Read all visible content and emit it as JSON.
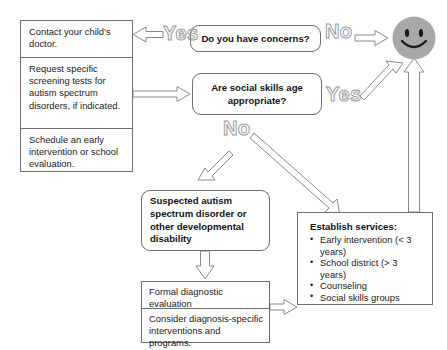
{
  "diagram": {
    "colors": {
      "stroke": "#6e6e6e",
      "text": "#1b1b1b",
      "arrow_stroke": "#8a8a8a",
      "label_outline": "#9a9a9a",
      "smiley_fill": "#a8a8a8",
      "background": "#ffffff"
    },
    "left_column": {
      "name": "action-steps",
      "cells": [
        {
          "text": "Contact your child’s doctor."
        },
        {
          "text": "Request specific screening tests for autism spectrum disorders, if indicated."
        },
        {
          "text": "Schedule an early intervention or school evaluation."
        }
      ]
    },
    "decisions": [
      {
        "id": "concerns",
        "text": "Do you have concerns?"
      },
      {
        "id": "social-skills",
        "text": "Are social skills age appropriate?"
      }
    ],
    "suspected": {
      "text": "Suspected autism spectrum disorder or other developmental disability"
    },
    "formal_stack": {
      "cells": [
        {
          "text": "Formal diagnostic evaluation"
        },
        {
          "text": "Consider diagnosis-specific interventions and programs."
        }
      ]
    },
    "services": {
      "title": "Establish services:",
      "items": [
        "Early intervention (< 3 years)",
        "School district (> 3 years)",
        "Counseling",
        "Social skills groups"
      ]
    },
    "edge_labels": [
      {
        "id": "yes-concerns",
        "text": "Yes"
      },
      {
        "id": "no-concerns",
        "text": "No"
      },
      {
        "id": "yes-social",
        "text": "Yes"
      },
      {
        "id": "no-social",
        "text": "No"
      }
    ],
    "outcome": {
      "name": "smiley-face",
      "text": "Good outcome"
    }
  }
}
